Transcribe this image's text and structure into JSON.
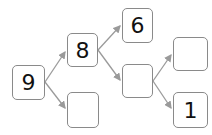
{
  "diagram": {
    "type": "number-decomposition-tree",
    "colors": {
      "border": "#8a8a8a",
      "arrow": "#9a9a9a",
      "text": "#111111"
    },
    "nodes": [
      {
        "id": "root",
        "value": "9",
        "x": 12,
        "y": 65,
        "w": 33,
        "h": 35
      },
      {
        "id": "n8",
        "value": "8",
        "x": 67,
        "y": 33,
        "w": 31,
        "h": 34
      },
      {
        "id": "n_blank_bottom",
        "value": "",
        "x": 67,
        "y": 92,
        "w": 32,
        "h": 36
      },
      {
        "id": "n6",
        "value": "6",
        "x": 122,
        "y": 8,
        "w": 31,
        "h": 35
      },
      {
        "id": "n_blank_middle",
        "value": "",
        "x": 122,
        "y": 64,
        "w": 31,
        "h": 34
      },
      {
        "id": "n_blank_top_right",
        "value": "",
        "x": 173,
        "y": 37,
        "w": 35,
        "h": 34
      },
      {
        "id": "n1",
        "value": "1",
        "x": 173,
        "y": 92,
        "w": 35,
        "h": 36
      }
    ],
    "edges": [
      {
        "from": "root",
        "to": "n8"
      },
      {
        "from": "root",
        "to": "n_blank_bottom"
      },
      {
        "from": "n8",
        "to": "n6"
      },
      {
        "from": "n8",
        "to": "n_blank_middle"
      },
      {
        "from": "n_blank_middle",
        "to": "n_blank_top_right"
      },
      {
        "from": "n_blank_middle",
        "to": "n1"
      }
    ]
  }
}
